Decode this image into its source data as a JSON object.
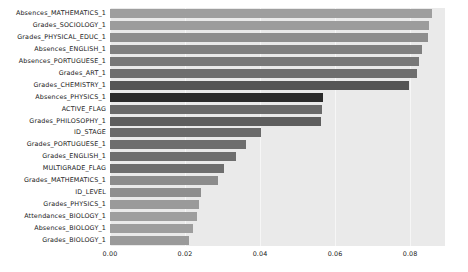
{
  "chart_data": {
    "type": "bar",
    "orientation": "horizontal",
    "title": "",
    "xlabel": "",
    "ylabel": "",
    "xlim": [
      0.0,
      0.0893
    ],
    "xticks": [
      0.0,
      0.02,
      0.04,
      0.06,
      0.08
    ],
    "xtick_labels": [
      "0.00",
      "0.02",
      "0.04",
      "0.06",
      "0.08"
    ],
    "grid": true,
    "grid_axis": "x",
    "legend": "none",
    "plot_background": "#eaeaea",
    "grid_color": "#f6f6f6",
    "categories": [
      "Absences_MATHEMATICS_1",
      "Grades_SOCIOLOGY_1",
      "Grades_PHYSICAL_EDUC_1",
      "Absences_ENGLISH_1",
      "Absences_PORTUGUESE_1",
      "Grades_ART_1",
      "Grades_CHEMISTRY_1",
      "Absences_PHYSICS_1",
      "ACTIVE_FLAG",
      "Grades_PHILOSOPHY_1",
      "ID_STAGE",
      "Grades_PORTUGUESE_1",
      "Grades_ENGLISH_1",
      "MULTIGRADE_FLAG",
      "Grades_MATHEMATICS_1",
      "ID_LEVEL",
      "Grades_PHYSICS_1",
      "Attendances_BIOLOGY_1",
      "Absences_BIOLOGY_1",
      "Grades_BIOLOGY_1"
    ],
    "values": [
      0.0859,
      0.0851,
      0.0848,
      0.0832,
      0.0824,
      0.0819,
      0.0797,
      0.0568,
      0.0565,
      0.0563,
      0.0403,
      0.0363,
      0.0336,
      0.0304,
      0.0288,
      0.0243,
      0.0237,
      0.0232,
      0.0221,
      0.0211
    ],
    "bar_colors": [
      "#9e9e9e",
      "#9c9c9c",
      "#8e8e8e",
      "#808080",
      "#787878",
      "#6e6e6e",
      "#555555",
      "#2b2b2b",
      "#6a6a6a",
      "#5e5e5e",
      "#6a6a6a",
      "#6e6e6e",
      "#6e6e6e",
      "#6e6e6e",
      "#8c8c8c",
      "#8e8e8e",
      "#9a9a9a",
      "#9e9e9e",
      "#9e9e9e",
      "#9a9a9a"
    ]
  }
}
